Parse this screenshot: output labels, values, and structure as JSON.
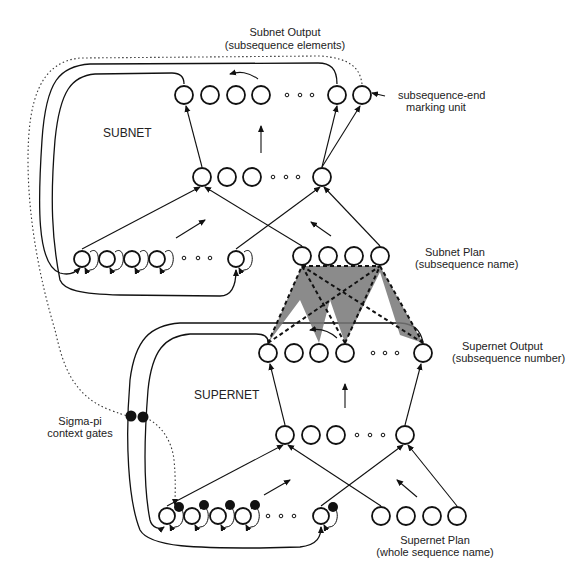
{
  "labels": {
    "subnet_output_title": "Subnet  Output",
    "subnet_output_sub": "(subsequence elements)",
    "end_marker_line1": "subsequence-end",
    "end_marker_line2": "marking unit",
    "subnet": "SUBNET",
    "subnet_plan_title": "Subnet Plan",
    "subnet_plan_sub": "(subsequence name)",
    "supernet_output_title": "Supernet Output",
    "supernet_output_sub": "(subsequence number)",
    "supernet": "SUPERNET",
    "sigma_pi_line1": "Sigma-pi",
    "sigma_pi_line2": "context gates",
    "supernet_plan_title": "Supernet Plan",
    "supernet_plan_sub": "(whole sequence name)"
  },
  "layers": {
    "subnet_output": {
      "y": 95,
      "nodes": [
        184,
        210,
        236,
        261,
        337,
        362
      ],
      "dots": [
        287,
        300,
        312
      ]
    },
    "subnet_hidden": {
      "y": 177,
      "nodes": [
        202,
        227,
        252,
        322
      ],
      "dots": [
        273,
        286,
        298
      ]
    },
    "subnet_context": {
      "y": 259,
      "nodes": [
        82,
        107,
        132,
        157,
        236
      ],
      "dots": [
        184,
        198,
        210
      ]
    },
    "subnet_plan": {
      "y": 256,
      "nodes": [
        302,
        328,
        354,
        380
      ]
    },
    "supernet_output": {
      "y": 353,
      "nodes": [
        268,
        294,
        319,
        345,
        423
      ],
      "dots": [
        373,
        385,
        397
      ]
    },
    "supernet_hidden": {
      "y": 435,
      "nodes": [
        285,
        311,
        336,
        405
      ],
      "dots": [
        357,
        370,
        383
      ]
    },
    "supernet_context": {
      "y": 516,
      "nodes": [
        167,
        192,
        218,
        243,
        321
      ],
      "dots": [
        268,
        281,
        294
      ]
    },
    "supernet_plan": {
      "y": 516,
      "nodes": [
        381,
        406,
        432,
        457
      ]
    }
  },
  "colors": {
    "line": "#111111",
    "shade": "#777777",
    "text": "#222222"
  }
}
